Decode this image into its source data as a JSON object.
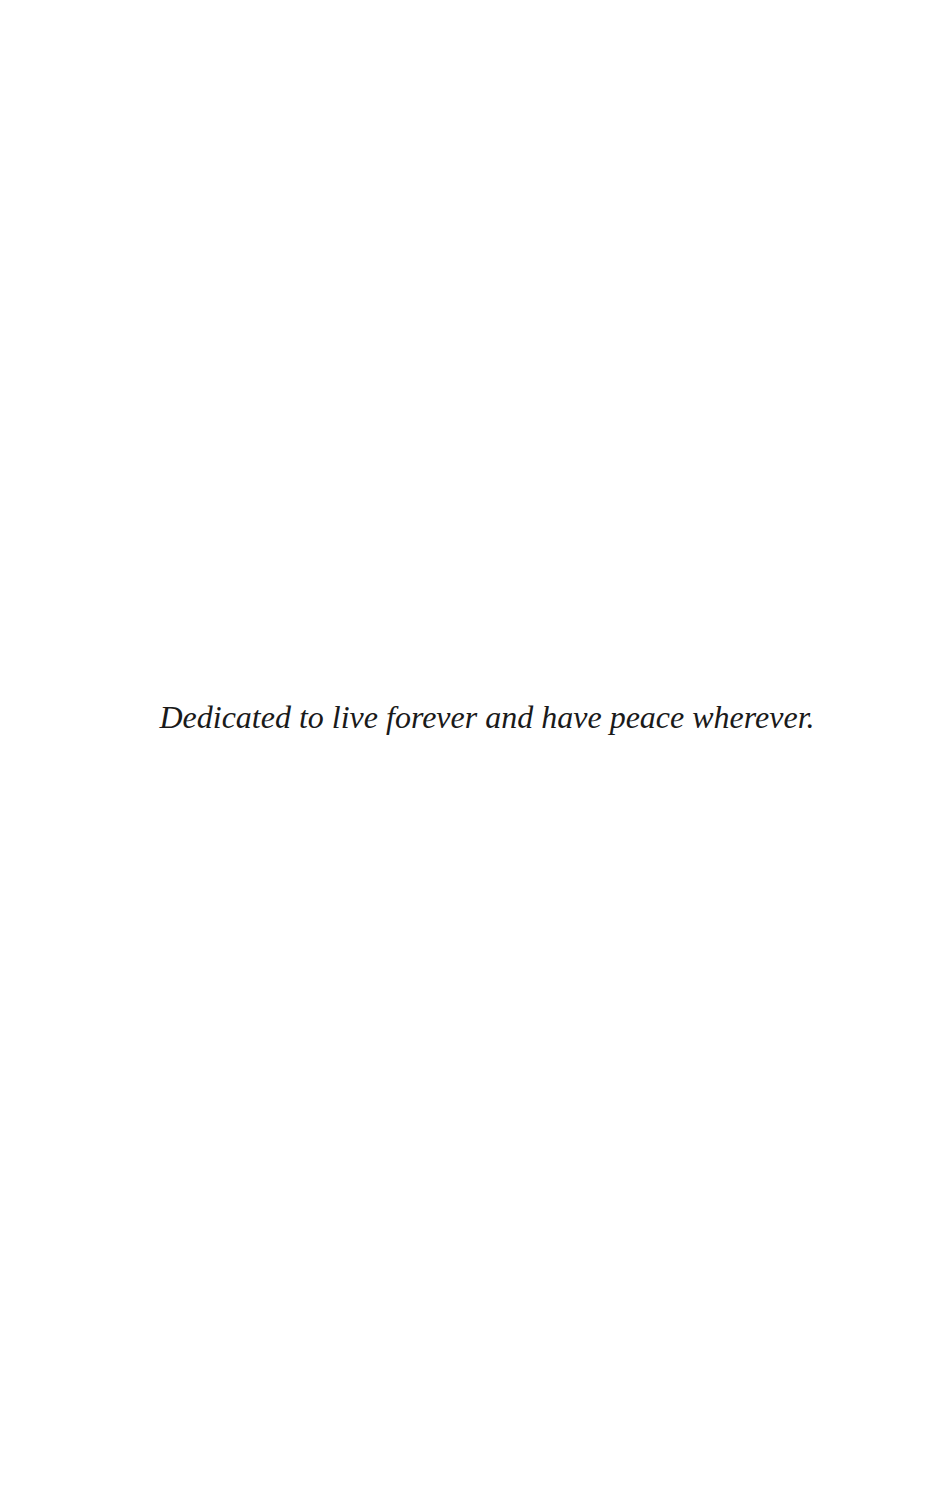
{
  "page": {
    "background_color": "#ffffff",
    "text_color": "#1a1a1a"
  },
  "dedication": {
    "text": "Dedicated to live forever and have peace wherever."
  }
}
